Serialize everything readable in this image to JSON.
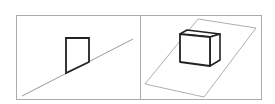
{
  "figure": {
    "panels": [
      {
        "id": "left",
        "description": "line with quadrilateral resting on it",
        "frame": {
          "x": 16,
          "y": 15,
          "w": 124,
          "h": 84
        },
        "line": {
          "x1": 22,
          "y1": 96,
          "x2": 133,
          "y2": 39
        },
        "shape": "66,38 89,38 89,62 66,73"
      },
      {
        "id": "right",
        "description": "cube resting on a tilted plane",
        "frame": {
          "x": 140,
          "y": 15,
          "w": 122,
          "h": 84
        },
        "plane": "198,19 256,28 204,97 145,84",
        "cube": {
          "front": "180,34 210,37 210,66 180,62",
          "top": "180,34 187,30 220,34 210,37",
          "side": "210,37 220,34 220,60 210,66"
        }
      }
    ],
    "colors": {
      "frame": "#aaaaaa",
      "thin_line": "#999999",
      "shape_stroke": "#222222"
    }
  }
}
